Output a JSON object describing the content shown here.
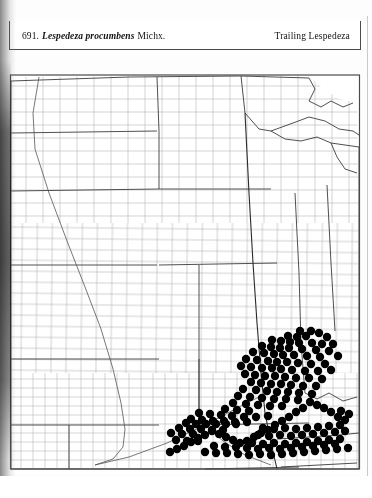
{
  "page": {
    "background_color": "#ffffff",
    "ink_color": "#111111",
    "dot_color": "#000000",
    "border_color": "#4a4a4a",
    "county_line_color": "#9a9a9a",
    "state_line_color": "#3c3c3c"
  },
  "header": {
    "entry_number": "691.",
    "scientific_name": "Lespedeza procumbens",
    "authority": "Michx.",
    "common_name": "Trailing Lespedeza"
  },
  "map": {
    "title": "County distribution map of the central United States",
    "symbol_legend": "filled circle = county record",
    "dot_radius_px": 4.2,
    "frame": {
      "x": 9,
      "y": 73,
      "width": 352,
      "height": 401
    },
    "states_outlined": [
      "Minnesota",
      "Wisconsin",
      "Michigan",
      "North Dakota",
      "South Dakota",
      "Nebraska",
      "Iowa",
      "Illinois",
      "Indiana",
      "Ohio",
      "Kansas",
      "Missouri",
      "Kentucky",
      "Oklahoma",
      "Arkansas",
      "Tennessee",
      "Texas"
    ],
    "dots": [
      [
        300,
        331
      ],
      [
        311,
        331
      ],
      [
        319,
        333
      ],
      [
        288,
        336
      ],
      [
        297,
        337
      ],
      [
        306,
        336
      ],
      [
        327,
        337
      ],
      [
        272,
        340
      ],
      [
        281,
        341
      ],
      [
        290,
        342
      ],
      [
        299,
        343
      ],
      [
        312,
        343
      ],
      [
        322,
        344
      ],
      [
        333,
        344
      ],
      [
        262,
        346
      ],
      [
        271,
        347
      ],
      [
        280,
        348
      ],
      [
        289,
        348
      ],
      [
        302,
        349
      ],
      [
        316,
        350
      ],
      [
        329,
        351
      ],
      [
        253,
        352
      ],
      [
        264,
        353
      ],
      [
        274,
        354
      ],
      [
        283,
        355
      ],
      [
        294,
        355
      ],
      [
        307,
        356
      ],
      [
        320,
        357
      ],
      [
        338,
        356
      ],
      [
        246,
        359
      ],
      [
        257,
        360
      ],
      [
        268,
        361
      ],
      [
        277,
        362
      ],
      [
        287,
        362
      ],
      [
        298,
        363
      ],
      [
        311,
        364
      ],
      [
        325,
        364
      ],
      [
        241,
        366
      ],
      [
        251,
        367
      ],
      [
        262,
        368
      ],
      [
        272,
        368
      ],
      [
        281,
        369
      ],
      [
        292,
        370
      ],
      [
        305,
        371
      ],
      [
        318,
        371
      ],
      [
        331,
        370
      ],
      [
        245,
        374
      ],
      [
        255,
        375
      ],
      [
        265,
        376
      ],
      [
        275,
        376
      ],
      [
        285,
        377
      ],
      [
        296,
        378
      ],
      [
        309,
        378
      ],
      [
        322,
        379
      ],
      [
        251,
        382
      ],
      [
        261,
        383
      ],
      [
        271,
        384
      ],
      [
        281,
        384
      ],
      [
        291,
        385
      ],
      [
        303,
        386
      ],
      [
        316,
        386
      ],
      [
        243,
        389
      ],
      [
        256,
        390
      ],
      [
        267,
        391
      ],
      [
        277,
        392
      ],
      [
        288,
        392
      ],
      [
        299,
        393
      ],
      [
        312,
        394
      ],
      [
        238,
        396
      ],
      [
        250,
        397
      ],
      [
        262,
        398
      ],
      [
        274,
        399
      ],
      [
        286,
        399
      ],
      [
        298,
        400
      ],
      [
        233,
        403
      ],
      [
        246,
        404
      ],
      [
        258,
        405
      ],
      [
        270,
        406
      ],
      [
        282,
        406
      ],
      [
        225,
        409
      ],
      [
        237,
        410
      ],
      [
        249,
        411
      ],
      [
        199,
        413
      ],
      [
        210,
        414
      ],
      [
        221,
        415
      ],
      [
        232,
        416
      ],
      [
        244,
        417
      ],
      [
        256,
        417
      ],
      [
        268,
        416
      ],
      [
        191,
        419
      ],
      [
        202,
        420
      ],
      [
        213,
        421
      ],
      [
        224,
        421
      ],
      [
        235,
        422
      ],
      [
        247,
        422
      ],
      [
        186,
        423
      ],
      [
        196,
        424
      ],
      [
        206,
        424
      ],
      [
        216,
        424
      ],
      [
        226,
        424
      ],
      [
        236,
        424
      ],
      [
        179,
        428
      ],
      [
        190,
        429
      ],
      [
        201,
        429
      ],
      [
        212,
        430
      ],
      [
        223,
        430
      ],
      [
        263,
        428
      ],
      [
        274,
        429
      ],
      [
        285,
        428
      ],
      [
        296,
        429
      ],
      [
        307,
        428
      ],
      [
        318,
        427
      ],
      [
        329,
        426
      ],
      [
        340,
        425
      ],
      [
        171,
        433
      ],
      [
        182,
        434
      ],
      [
        193,
        434
      ],
      [
        258,
        435
      ],
      [
        269,
        436
      ],
      [
        280,
        435
      ],
      [
        291,
        436
      ],
      [
        302,
        435
      ],
      [
        313,
        434
      ],
      [
        324,
        433
      ],
      [
        335,
        432
      ],
      [
        345,
        431
      ],
      [
        176,
        440
      ],
      [
        187,
        441
      ],
      [
        198,
        441
      ],
      [
        252,
        443
      ],
      [
        263,
        444
      ],
      [
        274,
        443
      ],
      [
        285,
        444
      ],
      [
        296,
        443
      ],
      [
        307,
        442
      ],
      [
        318,
        441
      ],
      [
        329,
        440
      ],
      [
        340,
        439
      ],
      [
        214,
        446
      ],
      [
        225,
        447
      ],
      [
        236,
        447
      ],
      [
        247,
        448
      ],
      [
        258,
        449
      ],
      [
        269,
        448
      ],
      [
        280,
        449
      ],
      [
        291,
        448
      ],
      [
        302,
        447
      ],
      [
        313,
        446
      ],
      [
        324,
        445
      ],
      [
        335,
        444
      ],
      [
        205,
        452
      ],
      [
        216,
        453
      ],
      [
        227,
        453
      ],
      [
        238,
        454
      ],
      [
        249,
        455
      ],
      [
        260,
        454
      ],
      [
        271,
        455
      ],
      [
        282,
        454
      ],
      [
        293,
        453
      ],
      [
        304,
        452
      ],
      [
        315,
        451
      ],
      [
        326,
        450
      ],
      [
        337,
        449
      ],
      [
        348,
        448
      ],
      [
        341,
        411
      ],
      [
        349,
        414
      ],
      [
        345,
        420
      ],
      [
        338,
        417
      ],
      [
        331,
        412
      ],
      [
        324,
        408
      ],
      [
        317,
        405
      ],
      [
        310,
        402
      ],
      [
        303,
        408
      ],
      [
        296,
        412
      ],
      [
        289,
        417
      ],
      [
        282,
        421
      ],
      [
        275,
        425
      ],
      [
        268,
        430
      ],
      [
        261,
        433
      ],
      [
        254,
        437
      ],
      [
        247,
        441
      ],
      [
        240,
        443
      ],
      [
        233,
        440
      ],
      [
        226,
        437
      ],
      [
        219,
        434
      ],
      [
        212,
        431
      ],
      [
        205,
        435
      ],
      [
        198,
        438
      ],
      [
        191,
        442
      ],
      [
        184,
        446
      ],
      [
        177,
        449
      ],
      [
        170,
        452
      ]
    ]
  }
}
